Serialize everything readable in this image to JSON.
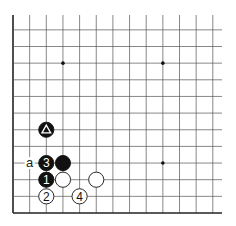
{
  "diagram": {
    "type": "go-board-fragment",
    "grid": {
      "origin_x": 13,
      "origin_y": 213,
      "spacing": 16.65,
      "columns": 13,
      "rows": 12,
      "line_color": "#555555",
      "edge_color": "#222222"
    },
    "star_points": [
      {
        "col": 3,
        "row": 9
      },
      {
        "col": 9,
        "row": 9
      },
      {
        "col": 9,
        "row": 3
      }
    ],
    "stones": [
      {
        "id": "triangle-black",
        "color": "black",
        "col": 2,
        "row": 5,
        "mark": "triangle",
        "label": ""
      },
      {
        "id": "move-3",
        "color": "black",
        "col": 2,
        "row": 3,
        "mark": "number",
        "label": "3"
      },
      {
        "id": "black-plain",
        "color": "black",
        "col": 3,
        "row": 3,
        "mark": "none",
        "label": ""
      },
      {
        "id": "move-1",
        "color": "black",
        "col": 2,
        "row": 2,
        "mark": "number",
        "label": "1"
      },
      {
        "id": "white-plain-1",
        "color": "white",
        "col": 3,
        "row": 2,
        "mark": "none",
        "label": ""
      },
      {
        "id": "white-plain-2",
        "color": "white",
        "col": 5,
        "row": 2,
        "mark": "none",
        "label": ""
      },
      {
        "id": "move-2",
        "color": "white",
        "col": 2,
        "row": 1,
        "mark": "number",
        "label": "2"
      },
      {
        "id": "move-4",
        "color": "white",
        "col": 4,
        "row": 1,
        "mark": "number",
        "label": "4"
      }
    ],
    "labels": [
      {
        "id": "point-a",
        "text": "a",
        "col": 1,
        "row": 3
      }
    ]
  }
}
